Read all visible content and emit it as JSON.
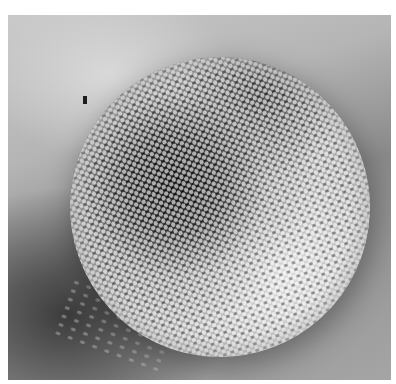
{
  "image": {
    "subject": "compound-eye-micrograph",
    "colors": {
      "background": "#ffffff",
      "photo_bg_light": "#c9c9c9",
      "photo_bg_dark": "#8a8a8a",
      "facet_highlight": "#f5f5f5",
      "shadow": "#1e1e1e"
    }
  }
}
